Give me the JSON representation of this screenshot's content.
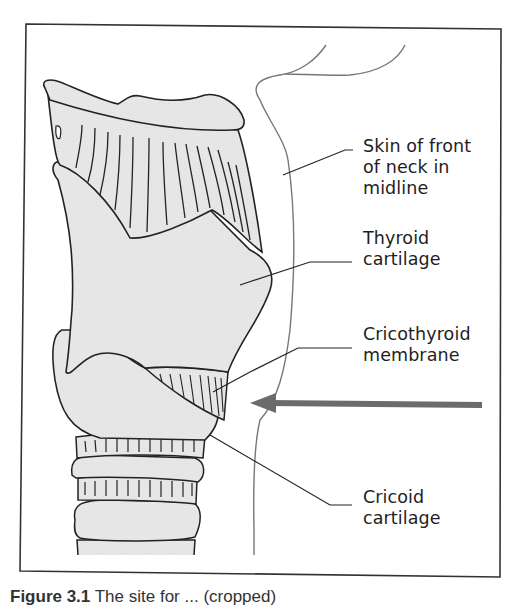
{
  "figure": {
    "type": "anatomical-diagram",
    "colors": {
      "frame": "#333333",
      "cartilage_fill": "#e6e6e6",
      "outline": "#222222",
      "skin_line": "#777777",
      "arrow": "#6b6b6b",
      "label_text": "#1e1e1e"
    },
    "labels": [
      {
        "id": "skin",
        "line1": "Skin of front",
        "line2": "of neck in",
        "line3": "midline"
      },
      {
        "id": "thyroid",
        "line1": "Thyroid",
        "line2": "cartilage"
      },
      {
        "id": "cricothyroid",
        "line1": "Cricothyroid",
        "line2": "membrane"
      },
      {
        "id": "cricoid",
        "line1": "Cricoid",
        "line2": "cartilage"
      }
    ],
    "arrow": {
      "direction": "left",
      "meaning": "site of puncture through cricothyroid membrane"
    },
    "caption": {
      "prefix": "Figure 3.1",
      "text": "The site for ... (cropped)"
    }
  }
}
